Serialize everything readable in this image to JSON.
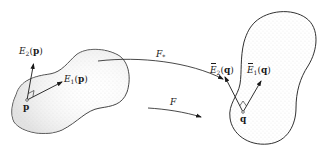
{
  "diagram": {
    "title": "",
    "colors": {
      "ink": "#1a1a1a",
      "stipple": "#9a9a9a",
      "background": "#ffffff"
    },
    "left_region": {
      "point_label": "p",
      "vectors": [
        {
          "symbol": "E",
          "index": "1",
          "arg": "p",
          "label_text": "E1(p)"
        },
        {
          "symbol": "E",
          "index": "2",
          "arg": "p",
          "label_text": "E2(p)"
        }
      ]
    },
    "right_region": {
      "point_label": "q",
      "vectors": [
        {
          "symbol": "Ē",
          "index": "1",
          "arg": "q",
          "label_text": "Ē1(q)"
        },
        {
          "symbol": "Ē",
          "index": "2",
          "arg": "q",
          "label_text": "Ē2(q)"
        }
      ]
    },
    "maps": [
      {
        "name": "F",
        "subscript": "*",
        "label_text": "F*",
        "kind": "curved-arrow"
      },
      {
        "name": "F",
        "subscript": "",
        "label_text": "F",
        "kind": "straight-arrow"
      }
    ],
    "symbols": {
      "E": "E",
      "Ebar": "E",
      "one": "1",
      "two": "2",
      "p": "p",
      "q": "q",
      "lparen": "(",
      "rparen": ")",
      "F": "F",
      "star": "*"
    }
  }
}
